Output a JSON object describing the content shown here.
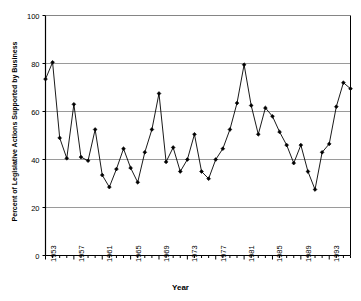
{
  "chart_data": {
    "type": "line",
    "title": "",
    "xlabel": "Year",
    "ylabel": "Percent of Legislative Actions Supported by Business",
    "xlim": [
      1953,
      1996
    ],
    "ylim": [
      0,
      100
    ],
    "yticks": [
      0,
      20,
      40,
      60,
      80,
      100
    ],
    "xticks": [
      1953,
      1957,
      1961,
      1965,
      1969,
      1973,
      1977,
      1981,
      1985,
      1989,
      1993
    ],
    "grid": "horizontal",
    "legend": "none",
    "marker": "filled-diamond",
    "line_color": "#000000",
    "grid_color": "#808080",
    "axis_color": "#000000",
    "x": [
      1953,
      1954,
      1955,
      1956,
      1957,
      1958,
      1959,
      1960,
      1961,
      1962,
      1963,
      1964,
      1965,
      1966,
      1967,
      1968,
      1969,
      1970,
      1971,
      1972,
      1973,
      1974,
      1975,
      1976,
      1977,
      1978,
      1979,
      1980,
      1981,
      1982,
      1983,
      1984,
      1985,
      1986,
      1987,
      1988,
      1989,
      1990,
      1991,
      1992,
      1993,
      1994,
      1995,
      1996
    ],
    "values": [
      73.5,
      80.5,
      49,
      40.5,
      63,
      41,
      39.5,
      52.5,
      33.5,
      28.5,
      36,
      44.5,
      36.5,
      30.5,
      43,
      52.5,
      67.5,
      39,
      45,
      35,
      40,
      50.5,
      35,
      32,
      40,
      44.5,
      52.5,
      63.5,
      79.5,
      62.5,
      50.5,
      61.5,
      58,
      51.5,
      46,
      38.5,
      46,
      35,
      27.5,
      43,
      46.5,
      62,
      72,
      69.5
    ]
  }
}
